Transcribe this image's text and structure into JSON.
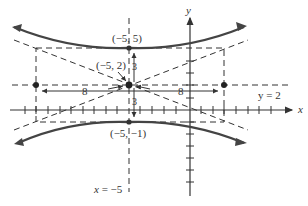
{
  "diagram": {
    "type": "hyperbola",
    "axis_labels": {
      "x": "x",
      "y": "y"
    },
    "points": {
      "center": "(−5, 2)",
      "top_vertex": "(−5, 5)",
      "bottom_vertex": "(−5, −1)"
    },
    "lines": {
      "horizontal": "y = 2",
      "vertical": "x = −5"
    },
    "distances": {
      "left": "8",
      "right": "8",
      "up": "3",
      "down": "3"
    },
    "colors": {
      "stroke": "#333333",
      "curve": "#444444"
    }
  }
}
